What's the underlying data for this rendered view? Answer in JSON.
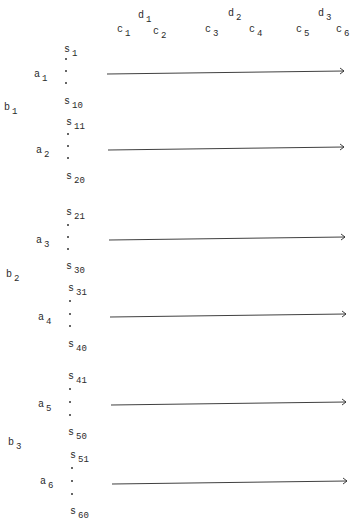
{
  "header": {
    "c_labels": [
      {
        "base": "c",
        "sub": "1",
        "x": 117,
        "y": 25
      },
      {
        "base": "c",
        "sub": "2",
        "x": 153,
        "y": 27
      },
      {
        "base": "c",
        "sub": "3",
        "x": 205,
        "y": 25
      },
      {
        "base": "c",
        "sub": "4",
        "x": 249,
        "y": 25
      },
      {
        "base": "c",
        "sub": "5",
        "x": 296,
        "y": 25
      },
      {
        "base": "c",
        "sub": "6",
        "x": 336,
        "y": 25
      }
    ],
    "d_labels": [
      {
        "base": "d",
        "sub": "1",
        "x": 138,
        "y": 11
      },
      {
        "base": "d",
        "sub": "2",
        "x": 228,
        "y": 9
      },
      {
        "base": "d",
        "sub": "3",
        "x": 318,
        "y": 9
      }
    ]
  },
  "b_labels": [
    {
      "base": "b",
      "sub": "1",
      "x": 4,
      "y": 103
    },
    {
      "base": "b",
      "sub": "2",
      "x": 6,
      "y": 270
    },
    {
      "base": "b",
      "sub": "3",
      "x": 8,
      "y": 438
    }
  ],
  "a_labels": [
    {
      "base": "a",
      "sub": "1",
      "x": 34,
      "y": 70
    },
    {
      "base": "a",
      "sub": "2",
      "x": 36,
      "y": 146
    },
    {
      "base": "a",
      "sub": "3",
      "x": 36,
      "y": 236
    },
    {
      "base": "a",
      "sub": "4",
      "x": 38,
      "y": 313
    },
    {
      "base": "a",
      "sub": "5",
      "x": 38,
      "y": 400
    },
    {
      "base": "a",
      "sub": "6",
      "x": 40,
      "y": 477
    }
  ],
  "s_groups": [
    {
      "top": {
        "base": "s",
        "sub": "1"
      },
      "bottom": {
        "base": "s",
        "sub": "10"
      },
      "x": 64,
      "top_y": 45,
      "bottom_y": 97,
      "dots_y": [
        58,
        70,
        82
      ]
    },
    {
      "top": {
        "base": "s",
        "sub": "11"
      },
      "bottom": {
        "base": "s",
        "sub": "20"
      },
      "x": 66,
      "top_y": 118,
      "bottom_y": 172,
      "dots_y": [
        133,
        145,
        157
      ]
    },
    {
      "top": {
        "base": "s",
        "sub": "21"
      },
      "bottom": {
        "base": "s",
        "sub": "30"
      },
      "x": 66,
      "top_y": 208,
      "bottom_y": 262,
      "dots_y": [
        224,
        236,
        248
      ]
    },
    {
      "top": {
        "base": "s",
        "sub": "31"
      },
      "bottom": {
        "base": "s",
        "sub": "40"
      },
      "x": 68,
      "top_y": 284,
      "bottom_y": 340,
      "dots_y": [
        300,
        313,
        325
      ]
    },
    {
      "top": {
        "base": "s",
        "sub": "41"
      },
      "bottom": {
        "base": "s",
        "sub": "50"
      },
      "x": 68,
      "top_y": 372,
      "bottom_y": 428,
      "dots_y": [
        388,
        401,
        414
      ]
    },
    {
      "top": {
        "base": "s",
        "sub": "51"
      },
      "bottom": {
        "base": "s",
        "sub": "60"
      },
      "x": 70,
      "top_y": 451,
      "bottom_y": 507,
      "dots_y": [
        467,
        480,
        493
      ]
    }
  ],
  "arrows": [
    {
      "x1": 107,
      "y1": 74,
      "x2": 344,
      "y2": 71
    },
    {
      "x1": 108,
      "y1": 150,
      "x2": 344,
      "y2": 147
    },
    {
      "x1": 109,
      "y1": 240,
      "x2": 345,
      "y2": 237
    },
    {
      "x1": 110,
      "y1": 317,
      "x2": 346,
      "y2": 314
    },
    {
      "x1": 111,
      "y1": 405,
      "x2": 346,
      "y2": 402
    },
    {
      "x1": 112,
      "y1": 484,
      "x2": 347,
      "y2": 481
    }
  ],
  "colors": {
    "ink": "#2a2a2a",
    "background": "#ffffff"
  }
}
